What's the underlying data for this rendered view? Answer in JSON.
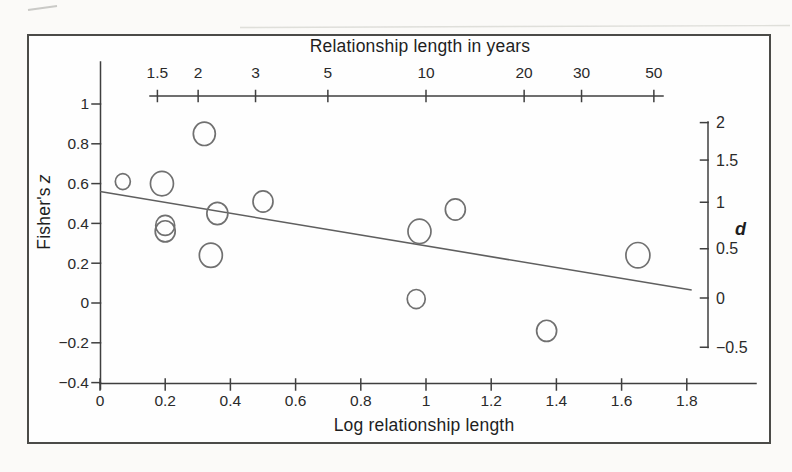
{
  "colors": {
    "frame": "#4b4b48",
    "axis": "#3f3f3f",
    "tick_text": "#2a2a2a",
    "regression_line": "#5f5f5f",
    "point_stroke": "#707070",
    "scan_artifact": "#d9d9d5"
  },
  "chart_data": {
    "type": "scatter",
    "title": "",
    "xlabel": "Log relationship length",
    "ylabel": "Fisher's z",
    "xlim": [
      0,
      1.9
    ],
    "ylim": [
      -0.4,
      1.05
    ],
    "grid": false,
    "legend": null,
    "bottom_axis": {
      "label": "Log relationship length",
      "ticks": [
        {
          "v": 0,
          "label": "0"
        },
        {
          "v": 0.2,
          "label": "0.2"
        },
        {
          "v": 0.4,
          "label": "0.4"
        },
        {
          "v": 0.6,
          "label": "0.6"
        },
        {
          "v": 0.8,
          "label": "0.8"
        },
        {
          "v": 1,
          "label": "1"
        },
        {
          "v": 1.2,
          "label": "1.2"
        },
        {
          "v": 1.4,
          "label": "1.4"
        },
        {
          "v": 1.6,
          "label": "1.6"
        },
        {
          "v": 1.8,
          "label": "1.8"
        }
      ]
    },
    "left_axis": {
      "label": "Fisher's z",
      "label_parts": [
        "Fisher's",
        "z"
      ],
      "ticks": [
        {
          "v": 1,
          "label": "1"
        },
        {
          "v": 0.8,
          "label": "0.8"
        },
        {
          "v": 0.6,
          "label": "0.6"
        },
        {
          "v": 0.4,
          "label": "0.4"
        },
        {
          "v": 0.2,
          "label": "0.2"
        },
        {
          "v": 0,
          "label": "0"
        },
        {
          "v": -0.2,
          "label": "−0.2"
        },
        {
          "v": -0.4,
          "label": "−0.4"
        }
      ]
    },
    "top_axis": {
      "label": "Relationship length in years",
      "scale": "log10",
      "ticks": [
        {
          "v": 1.5,
          "label": "1.5"
        },
        {
          "v": 2,
          "label": "2"
        },
        {
          "v": 3,
          "label": "3"
        },
        {
          "v": 5,
          "label": "5"
        },
        {
          "v": 10,
          "label": "10"
        },
        {
          "v": 20,
          "label": "20"
        },
        {
          "v": 30,
          "label": "30"
        },
        {
          "v": 50,
          "label": "50"
        }
      ]
    },
    "right_axis": {
      "label": "d",
      "transform": "d = 2r/sqrt(1-r^2), r = tanh(z)",
      "ticks": [
        {
          "v": 2,
          "label": "2"
        },
        {
          "v": 1.5,
          "label": "1.5"
        },
        {
          "v": 1,
          "label": "1"
        },
        {
          "v": 0.5,
          "label": "0.5"
        },
        {
          "v": 0,
          "label": "0"
        },
        {
          "v": -0.5,
          "label": "−0.5"
        }
      ]
    },
    "points": [
      {
        "x": 0.07,
        "y": 0.61,
        "r": 7.5
      },
      {
        "x": 0.19,
        "y": 0.6,
        "r": 11.5
      },
      {
        "x": 0.2,
        "y": 0.39,
        "r": 9.5
      },
      {
        "x": 0.2,
        "y": 0.36,
        "r": 10
      },
      {
        "x": 0.32,
        "y": 0.85,
        "r": 11
      },
      {
        "x": 0.34,
        "y": 0.24,
        "r": 11.5
      },
      {
        "x": 0.36,
        "y": 0.45,
        "r": 10.5
      },
      {
        "x": 0.5,
        "y": 0.51,
        "r": 10
      },
      {
        "x": 0.97,
        "y": 0.02,
        "r": 9
      },
      {
        "x": 0.98,
        "y": 0.36,
        "r": 11.5
      },
      {
        "x": 1.09,
        "y": 0.47,
        "r": 10
      },
      {
        "x": 1.37,
        "y": -0.14,
        "r": 10
      },
      {
        "x": 1.65,
        "y": 0.24,
        "r": 12
      }
    ],
    "regression_line": {
      "x1": 0,
      "y1": 0.56,
      "x2": 1.815,
      "y2": 0.065
    }
  }
}
